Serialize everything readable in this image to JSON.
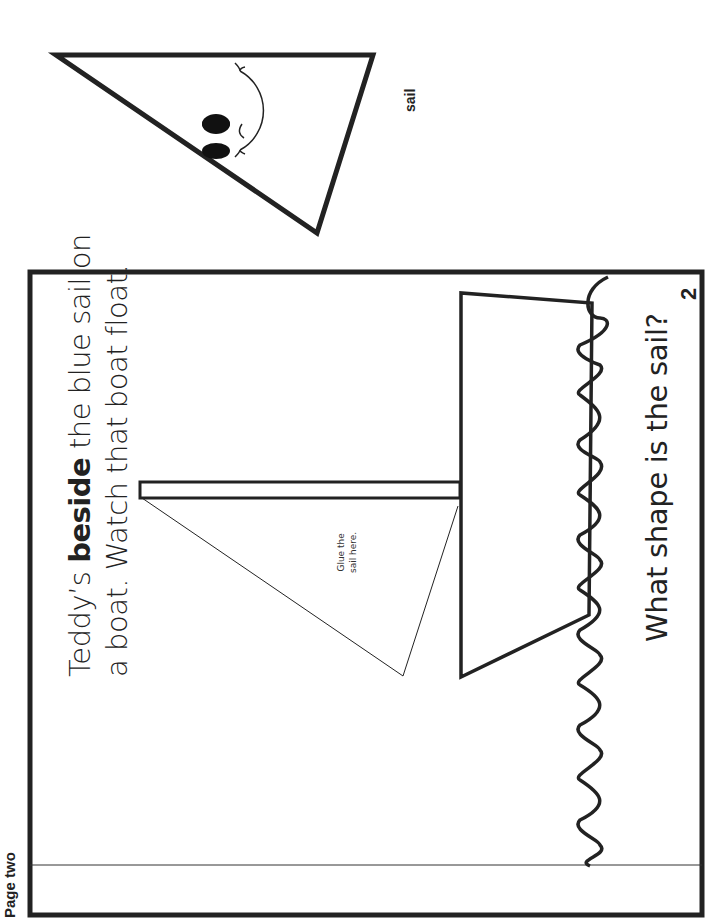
{
  "header": {
    "page_label": "Page two"
  },
  "story": {
    "line1_prefix": "Teddy’s ",
    "line1_bold": "beside",
    "line1_suffix": " the blue sail on",
    "line2": "a boat.  Watch that boat float."
  },
  "illustration": {
    "glue_line1": "Glue the",
    "glue_line2": "sail here."
  },
  "question": "What shape is the sail?",
  "page_number": "2",
  "cutout": {
    "label": "sail"
  },
  "colors": {
    "ink": "#222222",
    "background": "#ffffff"
  }
}
